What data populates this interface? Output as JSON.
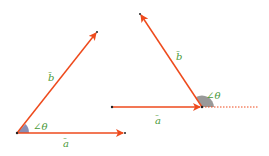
{
  "colors": {
    "vector": "#ee4a1c",
    "label": "#4a9a3a",
    "angle_fill": "#8a8fb5",
    "angle_fill_obtuse": "#999999",
    "point": "#222222"
  },
  "diagrams": [
    {
      "name": "acute-angle",
      "vector_a_label": "a",
      "vector_b_label": "b",
      "angle_label": "∠θ"
    },
    {
      "name": "obtuse-angle",
      "vector_a_label": "a",
      "vector_b_label": "b",
      "angle_label": "∠θ"
    }
  ]
}
